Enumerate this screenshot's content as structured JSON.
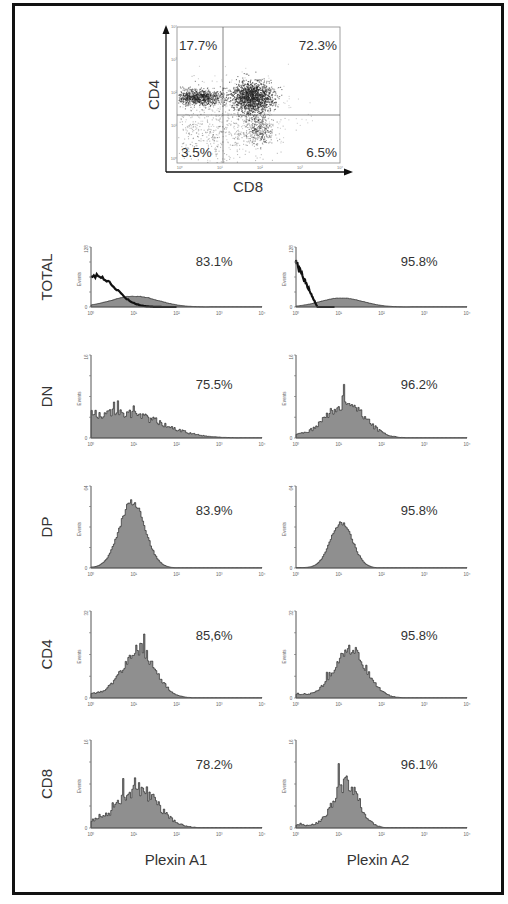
{
  "colors": {
    "fill": "#8f8f8f",
    "outline": "#2b2b2b",
    "control": "#111111",
    "text": "#333333",
    "axis": "#555555",
    "frame": "#111111"
  },
  "chart_data": [
    {
      "type": "scatter",
      "title": "",
      "xlabel": "CD8",
      "ylabel": "CD4",
      "scale": "log",
      "x_ticks": [
        "10^0",
        "10^1",
        "10^2",
        "10^3",
        "10^4"
      ],
      "y_ticks": [
        "10^0",
        "10^1",
        "10^2",
        "10^3",
        "10^4"
      ],
      "quadrants": [
        {
          "position": "upper-left",
          "label": "17.7%",
          "population": "CD4+CD8-"
        },
        {
          "position": "upper-right",
          "label": "72.3%",
          "population": "CD4+CD8+"
        },
        {
          "position": "lower-left",
          "label": "3.5%",
          "population": "CD4-CD8-"
        },
        {
          "position": "lower-right",
          "label": "6.5%",
          "population": "CD4-CD8+"
        }
      ]
    },
    {
      "type": "area",
      "subtype": "histogram-grid",
      "columns": [
        "Plexin A1",
        "Plexin A2"
      ],
      "rows": [
        "TOTAL",
        "DN",
        "DP",
        "CD4",
        "CD8"
      ],
      "ylabel": "Events",
      "x_ticks": [
        "10^0",
        "10^1",
        "10^2",
        "10^3",
        "10^4"
      ],
      "xscale": "log",
      "panels": [
        {
          "row": "TOTAL",
          "column": "Plexin A1",
          "ymax": 128,
          "percent": "83.1%",
          "control_curve": true
        },
        {
          "row": "TOTAL",
          "column": "Plexin A2",
          "ymax": 128,
          "percent": "95.8%",
          "control_curve": true
        },
        {
          "row": "DN",
          "column": "Plexin A1",
          "ymax": 16,
          "percent": "75.5%"
        },
        {
          "row": "DN",
          "column": "Plexin A2",
          "ymax": 16,
          "percent": "96.2%"
        },
        {
          "row": "DP",
          "column": "Plexin A1",
          "ymax": 64,
          "percent": "83.9%"
        },
        {
          "row": "DP",
          "column": "Plexin A2",
          "ymax": 64,
          "percent": "95.8%"
        },
        {
          "row": "CD4",
          "column": "Plexin A1",
          "ymax": 32,
          "percent": "85,6%"
        },
        {
          "row": "CD4",
          "column": "Plexin A2",
          "ymax": 32,
          "percent": "95.8%"
        },
        {
          "row": "CD8",
          "column": "Plexin A1",
          "ymax": 16,
          "percent": "78.2%"
        },
        {
          "row": "CD8",
          "column": "Plexin A2",
          "ymax": 16,
          "percent": "96.1%"
        }
      ]
    }
  ],
  "dotplot": {
    "xlabel": "CD8",
    "ylabel": "CD4",
    "ticks": [
      "10⁰",
      "10¹",
      "10²",
      "10³",
      "10⁴"
    ],
    "q_ul": "17.7%",
    "q_ur": "72.3%",
    "q_ll": "3.5%",
    "q_lr": "6.5%"
  },
  "histograms": {
    "ylabel": "Events",
    "ticks": [
      "10⁰",
      "10¹",
      "10²",
      "10³",
      "10⁴"
    ],
    "columns": [
      "Plexin A1",
      "Plexin A2"
    ],
    "rows": [
      {
        "label": "TOTAL",
        "ymax": "128",
        "zero": "0",
        "a1": "83.1%",
        "a2": "95.8%",
        "a1_peak": [
          1.0,
          0.55,
          0.18,
          0.0
        ],
        "a2_peak": [
          1.05,
          0.5,
          0.15,
          0.0
        ],
        "control": true,
        "noise": 0.03
      },
      {
        "label": "DN",
        "ymax": "16",
        "zero": "0",
        "a1": "75.5%",
        "a2": "96.2%",
        "a1_peak": [
          0.9,
          0.8,
          0.25,
          0.25
        ],
        "a2_peak": [
          1.15,
          0.45,
          0.4,
          0.05
        ],
        "control": false,
        "noise": 0.2
      },
      {
        "label": "DP",
        "ymax": "64",
        "zero": "0",
        "a1": "83.9%",
        "a2": "95.8%",
        "a1_peak": [
          0.95,
          0.3,
          0.8,
          0.01
        ],
        "a2_peak": [
          1.05,
          0.26,
          0.55,
          0.01
        ],
        "control": false,
        "noise": 0.05
      },
      {
        "label": "CD4",
        "ymax": "32",
        "zero": "0",
        "a1": "85,6%",
        "a2": "95.8%",
        "a1_peak": [
          1.1,
          0.38,
          0.55,
          0.08
        ],
        "a2_peak": [
          1.25,
          0.38,
          0.55,
          0.06
        ],
        "control": false,
        "noise": 0.14
      },
      {
        "label": "CD8",
        "ymax": "16",
        "zero": "0",
        "a1": "78.2%",
        "a2": "96.1%",
        "a1_peak": [
          1.1,
          0.45,
          0.42,
          0.12
        ],
        "a2_peak": [
          1.15,
          0.3,
          0.5,
          0.06
        ],
        "control": false,
        "noise": 0.2
      }
    ]
  }
}
